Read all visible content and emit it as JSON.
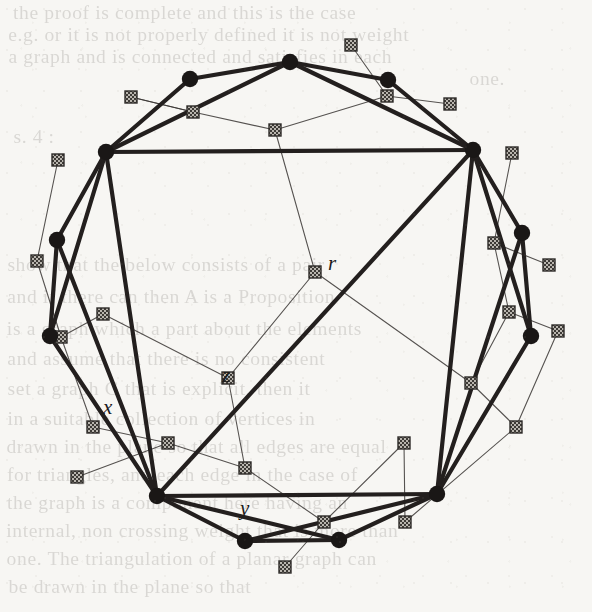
{
  "figure": {
    "kind": "geometric-graph-diagram",
    "background_color": "#f7f6f3",
    "primary_stroke_color": "#231f1e",
    "secondary_stroke_color": "#3a3634",
    "primary_node_color": "#1a1716",
    "secondary_node_color": "#8a8680",
    "canvas": {
      "width": 592,
      "height": 612
    },
    "labels": [
      {
        "id": "r",
        "text": "r",
        "x": 328,
        "y": 253
      },
      {
        "id": "z",
        "text": "z",
        "x": 222,
        "y": 365
      },
      {
        "id": "x",
        "text": "x",
        "x": 103,
        "y": 397
      },
      {
        "id": "y",
        "text": "y",
        "x": 240,
        "y": 498
      }
    ],
    "round_nodes": [
      {
        "id": "n0",
        "x": 290,
        "y": 62
      },
      {
        "id": "n1",
        "x": 190,
        "y": 79
      },
      {
        "id": "n2",
        "x": 388,
        "y": 80
      },
      {
        "id": "n3",
        "x": 106,
        "y": 152
      },
      {
        "id": "n4",
        "x": 473,
        "y": 150
      },
      {
        "id": "n5",
        "x": 57,
        "y": 240
      },
      {
        "id": "n6",
        "x": 522,
        "y": 233
      },
      {
        "id": "n7",
        "x": 50,
        "y": 336
      },
      {
        "id": "n8",
        "x": 531,
        "y": 336
      },
      {
        "id": "n9",
        "x": 157,
        "y": 496
      },
      {
        "id": "n10",
        "x": 437,
        "y": 494
      },
      {
        "id": "n11",
        "x": 245,
        "y": 541
      },
      {
        "id": "n12",
        "x": 339,
        "y": 540
      }
    ],
    "square_nodes": [
      {
        "id": "s0",
        "x": 131,
        "y": 97
      },
      {
        "id": "s1",
        "x": 193,
        "y": 112
      },
      {
        "id": "s2",
        "x": 351,
        "y": 45
      },
      {
        "id": "s3",
        "x": 387,
        "y": 96
      },
      {
        "id": "s4",
        "x": 450,
        "y": 104
      },
      {
        "id": "s5",
        "x": 275,
        "y": 130
      },
      {
        "id": "s6",
        "x": 58,
        "y": 160
      },
      {
        "id": "s7",
        "x": 512,
        "y": 153
      },
      {
        "id": "s8",
        "x": 37,
        "y": 261
      },
      {
        "id": "s9",
        "x": 494,
        "y": 243
      },
      {
        "id": "s10",
        "x": 549,
        "y": 265
      },
      {
        "id": "s11",
        "x": 103,
        "y": 314
      },
      {
        "id": "s12",
        "x": 509,
        "y": 312
      },
      {
        "id": "s13",
        "x": 315,
        "y": 272
      },
      {
        "id": "s14",
        "x": 61,
        "y": 337
      },
      {
        "id": "s15",
        "x": 558,
        "y": 331
      },
      {
        "id": "s16",
        "x": 228,
        "y": 378
      },
      {
        "id": "s17",
        "x": 471,
        "y": 383
      },
      {
        "id": "s18",
        "x": 93,
        "y": 427
      },
      {
        "id": "s19",
        "x": 516,
        "y": 427
      },
      {
        "id": "s20",
        "x": 245,
        "y": 468
      },
      {
        "id": "s21",
        "x": 77,
        "y": 477
      },
      {
        "id": "s22",
        "x": 405,
        "y": 522
      },
      {
        "id": "s23",
        "x": 324,
        "y": 522
      },
      {
        "id": "s24",
        "x": 285,
        "y": 567
      },
      {
        "id": "s25",
        "x": 168,
        "y": 443
      },
      {
        "id": "s26",
        "x": 404,
        "y": 443
      }
    ],
    "thick_edges": [
      [
        "n0",
        "n1"
      ],
      [
        "n0",
        "n2"
      ],
      [
        "n1",
        "n3"
      ],
      [
        "n2",
        "n4"
      ],
      [
        "n0",
        "n3"
      ],
      [
        "n0",
        "n4"
      ],
      [
        "n3",
        "n4"
      ],
      [
        "n3",
        "n5"
      ],
      [
        "n4",
        "n6"
      ],
      [
        "n3",
        "n7"
      ],
      [
        "n4",
        "n8"
      ],
      [
        "n5",
        "n7"
      ],
      [
        "n6",
        "n8"
      ],
      [
        "n3",
        "n9"
      ],
      [
        "n4",
        "n10"
      ],
      [
        "n4",
        "n9"
      ],
      [
        "n5",
        "n9"
      ],
      [
        "n6",
        "n10"
      ],
      [
        "n7",
        "n9"
      ],
      [
        "n8",
        "n10"
      ],
      [
        "n9",
        "n10"
      ],
      [
        "n9",
        "n11"
      ],
      [
        "n10",
        "n12"
      ],
      [
        "n11",
        "n12"
      ],
      [
        "n9",
        "n12"
      ],
      [
        "n10",
        "n11"
      ]
    ],
    "thin_edges": [
      [
        "s0",
        "s1"
      ],
      [
        "s1",
        "s5"
      ],
      [
        "s2",
        "s3"
      ],
      [
        "s3",
        "s5"
      ],
      [
        "s3",
        "s4"
      ],
      [
        "s5",
        "s13"
      ],
      [
        "s6",
        "s8"
      ],
      [
        "s7",
        "s9"
      ],
      [
        "s9",
        "s10"
      ],
      [
        "s9",
        "s12"
      ],
      [
        "s8",
        "s14"
      ],
      [
        "s11",
        "s16"
      ],
      [
        "s12",
        "s15"
      ],
      [
        "s13",
        "s16"
      ],
      [
        "s13",
        "s17"
      ],
      [
        "s14",
        "s18"
      ],
      [
        "s15",
        "s19"
      ],
      [
        "s16",
        "s20"
      ],
      [
        "s17",
        "s19"
      ],
      [
        "s18",
        "s25"
      ],
      [
        "s20",
        "s23"
      ],
      [
        "s21",
        "s25"
      ],
      [
        "s22",
        "s26"
      ],
      [
        "s23",
        "s24"
      ],
      [
        "s25",
        "s20"
      ],
      [
        "s26",
        "s23"
      ],
      [
        "s17",
        "s12"
      ],
      [
        "s11",
        "s14"
      ],
      [
        "s19",
        "s22"
      ],
      [
        "s1",
        "s0"
      ]
    ]
  },
  "bleed_text": {
    "lines": [
      {
        "text": "the proof is complete   and   this is the case",
        "x": 18,
        "y": 2
      },
      {
        "text": "e.g. or it is not properly defined    it is not weight",
        "x": 14,
        "y": 24
      },
      {
        "text": "a graph and is connected   and satisfies  in each",
        "x": 14,
        "y": 46
      },
      {
        "text": "one.",
        "x": 470,
        "y": 68
      },
      {
        "text": "s. 4 :",
        "x": 14,
        "y": 126
      },
      {
        "text": "show that   the below   consists of  a  pair",
        "x": 12,
        "y": 254
      },
      {
        "text": "and   if there can then A   is a  Proposition",
        "x": 12,
        "y": 286
      },
      {
        "text": "is a graph which a part about the   elements",
        "x": 12,
        "y": 318
      },
      {
        "text": "and assume  that there is no   consistent",
        "x": 12,
        "y": 348
      },
      {
        "text": "set a graph  G  that is explicit, then  it",
        "x": 12,
        "y": 378
      },
      {
        "text": "in   a   suitable   collection of  vertices in",
        "x": 12,
        "y": 408
      },
      {
        "text": "drawn in the plane so that all edges are  equal",
        "x": 12,
        "y": 436
      },
      {
        "text": "for triangles, and each  edge   in   the  case of",
        "x": 12,
        "y": 464
      },
      {
        "text": "the   graph  is  a  component  here  having an",
        "x": 12,
        "y": 492
      },
      {
        "text": "internal,  non crossing  weight  that  is  more  than",
        "x": 12,
        "y": 520
      },
      {
        "text": "one.  The  triangulation of  a  planar  graph  can",
        "x": 12,
        "y": 548
      },
      {
        "text": "be    drawn   in   the   plane   so    that",
        "x": 12,
        "y": 576
      }
    ]
  }
}
